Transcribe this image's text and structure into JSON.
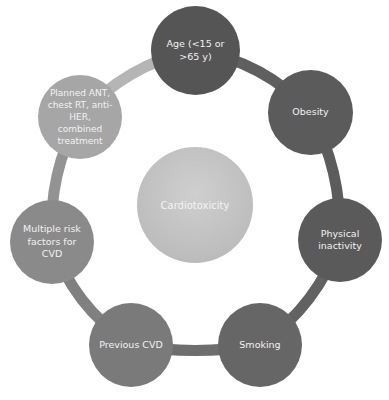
{
  "diagram": {
    "type": "cycle",
    "center": {
      "label": "Cardiotoxicity",
      "color": "#c4c4c4"
    },
    "nodes": [
      {
        "id": "age",
        "label": "Age (<15 or >65 y)",
        "color": "#555555"
      },
      {
        "id": "obesity",
        "label": "Obesity",
        "color": "#5b5b5b"
      },
      {
        "id": "physical-inactivity",
        "label": "Physical inactivity",
        "color": "#5a5a5a"
      },
      {
        "id": "smoking",
        "label": "Smoking",
        "color": "#666666"
      },
      {
        "id": "previous-cvd",
        "label": "Previous CVD",
        "color": "#7a7a7a"
      },
      {
        "id": "multiple-risk-factors",
        "label": "Multiple risk factors for CVD",
        "color": "#8a8a8a"
      },
      {
        "id": "planned-treatment",
        "label": "Planned ANT, chest RT, anti-HER, combined treatment",
        "color": "#a6a6a6"
      }
    ],
    "ring_colors": {
      "age_to_obesity": "#5f5f5f",
      "obesity_to_inactivity": "#5c5c5c",
      "inactivity_to_smoking": "#626262",
      "smoking_to_previous": "#6e6e6e",
      "previous_to_multiple": "#808080",
      "multiple_to_planned": "#939393",
      "planned_to_age": "#b5b5b5"
    }
  }
}
